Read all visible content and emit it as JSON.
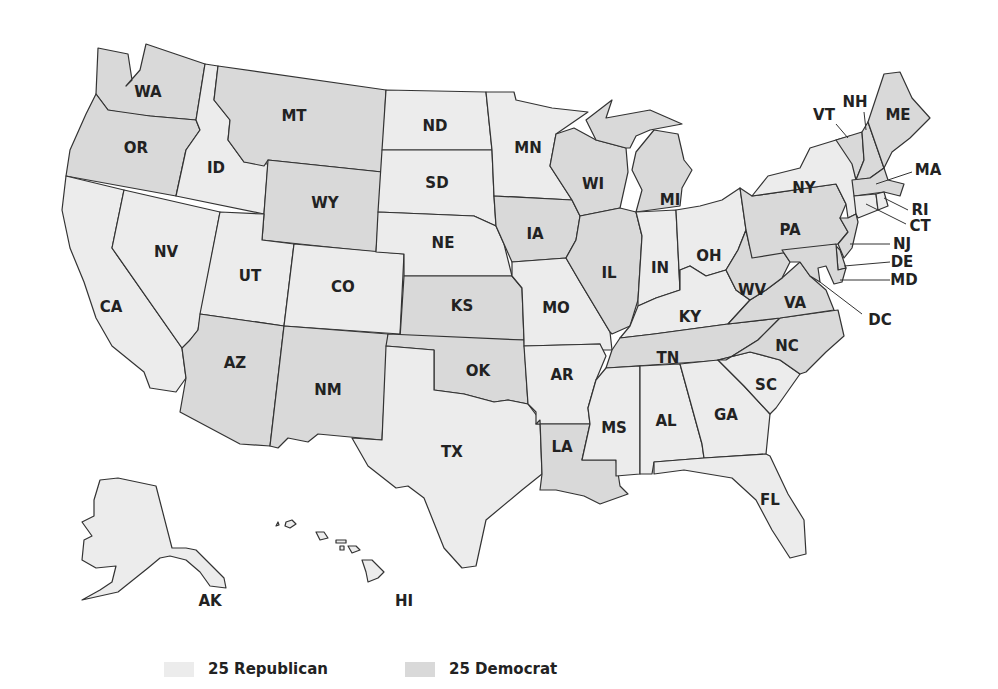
{
  "colors": {
    "republican": "#ececec",
    "democrat": "#d9d9d9",
    "stroke": "#333333"
  },
  "legend": [
    {
      "label": "25 Republican",
      "party": "rep"
    },
    {
      "label": "25 Democrat",
      "party": "dem"
    }
  ],
  "states": {
    "WA": "dem",
    "OR": "dem",
    "CA": "rep",
    "ID": "rep",
    "NV": "rep",
    "MT": "dem",
    "WY": "dem",
    "UT": "rep",
    "CO": "rep",
    "AZ": "dem",
    "NM": "dem",
    "ND": "rep",
    "SD": "rep",
    "NE": "rep",
    "KS": "dem",
    "OK": "dem",
    "TX": "rep",
    "MN": "rep",
    "IA": "dem",
    "MO": "rep",
    "AR": "rep",
    "LA": "dem",
    "WI": "dem",
    "IL": "dem",
    "MI": "dem",
    "IN": "rep",
    "OH": "rep",
    "KY": "rep",
    "TN": "dem",
    "MS": "rep",
    "AL": "rep",
    "GA": "rep",
    "FL": "rep",
    "SC": "rep",
    "NC": "dem",
    "VA": "dem",
    "WV": "dem",
    "PA": "dem",
    "NY": "rep",
    "VT": "dem",
    "NH": "dem",
    "ME": "dem",
    "MA": "dem",
    "RI": "rep",
    "CT": "rep",
    "NJ": "dem",
    "DE": "dem",
    "MD": "dem",
    "AK": "rep",
    "HI": "rep"
  },
  "labels": {
    "WA": "WA",
    "OR": "OR",
    "CA": "CA",
    "ID": "ID",
    "NV": "NV",
    "MT": "MT",
    "WY": "WY",
    "UT": "UT",
    "CO": "CO",
    "AZ": "AZ",
    "NM": "NM",
    "ND": "ND",
    "SD": "SD",
    "NE": "NE",
    "KS": "KS",
    "OK": "OK",
    "TX": "TX",
    "MN": "MN",
    "IA": "IA",
    "MO": "MO",
    "AR": "AR",
    "LA": "LA",
    "WI": "WI",
    "IL": "IL",
    "MI": "MI",
    "IN": "IN",
    "OH": "OH",
    "KY": "KY",
    "TN": "TN",
    "MS": "MS",
    "AL": "AL",
    "GA": "GA",
    "FL": "FL",
    "SC": "SC",
    "NC": "NC",
    "VA": "VA",
    "WV": "WV",
    "PA": "PA",
    "NY": "NY",
    "VT": "VT",
    "NH": "NH",
    "ME": "ME",
    "MA": "MA",
    "RI": "RI",
    "CT": "CT",
    "NJ": "NJ",
    "DE": "DE",
    "MD": "MD",
    "DC": "DC",
    "AK": "AK",
    "HI": "HI"
  }
}
